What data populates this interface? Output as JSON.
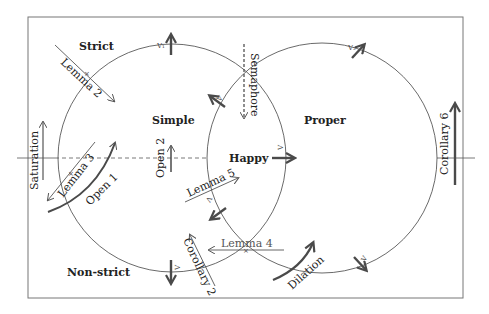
{
  "diagram": {
    "frame": {
      "x": 28,
      "y": 17,
      "width": 435,
      "height": 281,
      "stroke": "#777777"
    },
    "circles": [
      {
        "name": "left-circle",
        "cx": 172,
        "cy": 158,
        "r": 114
      },
      {
        "name": "right-circle",
        "cx": 322,
        "cy": 158,
        "r": 115
      }
    ],
    "region_labels": {
      "strict": "Strict",
      "simple": "Simple",
      "proper": "Proper",
      "happy": "Happy",
      "non_strict": "Non-strict"
    },
    "annotations": {
      "lemma2": "Lemma 2",
      "lemma3": "Lemma 3",
      "lemma4": "Lemma 4",
      "lemma5": "Lemma 5",
      "open1": "Open 1",
      "open2": "Open 2",
      "saturation": "Saturation",
      "semaphore": "Semaphore",
      "corollary2": "Corollary 2",
      "corollary6": "Corollary 6",
      "dilation": "Dilation"
    },
    "marks": {
      "top_left": "V₁",
      "upper_mid": "V",
      "right_top": "V₂",
      "happy": "V",
      "lower_mid": "Λ",
      "bottom_left": "V",
      "bottom_right": "V"
    },
    "colors": {
      "line": "#555555",
      "thick_arrow": "#4a4a4a",
      "text": "#222222"
    }
  }
}
